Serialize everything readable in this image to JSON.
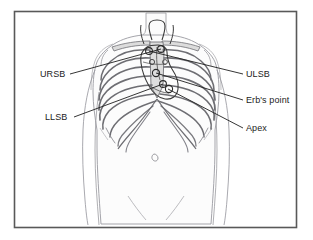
{
  "figure": {
    "frame": {
      "border_color": "#595959",
      "background_color": "#ffffff",
      "x": 14,
      "y": 11,
      "width": 283,
      "height": 217
    },
    "body_colors": {
      "outline": "#8d8d93",
      "skin_fill": "#fbfbfb",
      "bone_outline": "#6e6e73",
      "bone_fill": "#d8d8d8",
      "heart_outline": "#3a3a3a",
      "leader_line": "#222222",
      "text": "#1c1c1c"
    },
    "labels": [
      {
        "id": "ursb",
        "text": "URSB",
        "side": "left",
        "text_x": 40,
        "text_y": 74,
        "leader_from_x": 70,
        "leader_from_y": 74,
        "leader_to_x": 161,
        "leader_to_y": 49
      },
      {
        "id": "llsb",
        "text": "LLSB",
        "side": "left",
        "text_x": 45,
        "text_y": 117,
        "leader_from_x": 74,
        "leader_from_y": 117,
        "leader_to_x": 163,
        "leader_to_y": 84
      },
      {
        "id": "ulsb",
        "text": "ULSB",
        "side": "right",
        "text_x": 246,
        "text_y": 74,
        "leader_from_x": 243,
        "leader_from_y": 74,
        "leader_to_x": 149,
        "leader_to_y": 51
      },
      {
        "id": "erbs",
        "text": "Erb's point",
        "side": "right",
        "text_x": 246,
        "text_y": 100,
        "leader_from_x": 243,
        "leader_from_y": 100,
        "leader_to_x": 156,
        "leader_to_y": 73
      },
      {
        "id": "apex",
        "text": "Apex",
        "side": "right",
        "text_x": 246,
        "text_y": 128,
        "leader_from_x": 243,
        "leader_from_y": 128,
        "leader_to_x": 168,
        "leader_to_y": 89
      }
    ],
    "auscultation_points": [
      {
        "id": "ursb",
        "name": "Upper Right Sternal Border",
        "x": 161,
        "y": 49
      },
      {
        "id": "ulsb",
        "name": "Upper Left Sternal Border",
        "x": 149,
        "y": 51
      },
      {
        "id": "erbs",
        "name": "Erb's point",
        "x": 156,
        "y": 73
      },
      {
        "id": "llsb",
        "name": "Lower Left Sternal Border",
        "x": 163,
        "y": 84
      },
      {
        "id": "apex",
        "name": "Apex",
        "x": 168,
        "y": 89
      }
    ]
  }
}
